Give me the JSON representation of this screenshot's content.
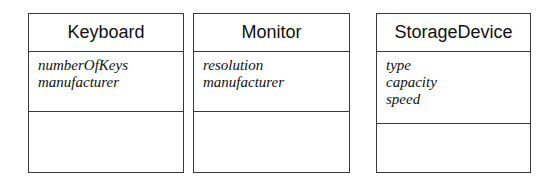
{
  "diagram": {
    "type": "uml-class-diagram",
    "classes": [
      {
        "name": "Keyboard",
        "attributes": [
          "numberOfKeys",
          "manufacturer"
        ],
        "operations": []
      },
      {
        "name": "Monitor",
        "attributes": [
          "resolution",
          "manufacturer"
        ],
        "operations": []
      },
      {
        "name": "StorageDevice",
        "attributes": [
          "type",
          "capacity",
          "speed"
        ],
        "operations": []
      }
    ]
  }
}
